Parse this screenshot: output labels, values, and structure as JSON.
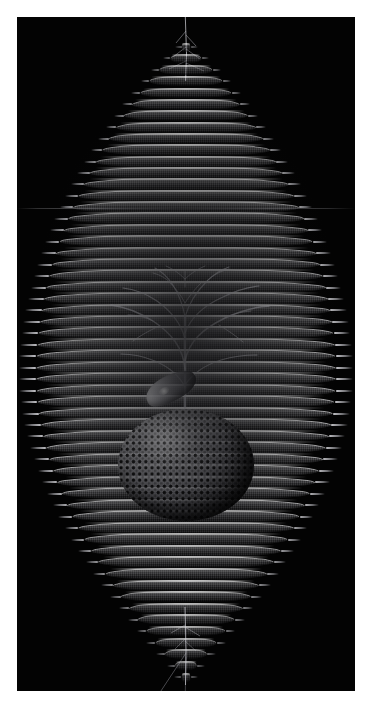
{
  "image": {
    "kind": "scientific-micrograph",
    "subject": "radiolarian-lattice-skeleton",
    "caption": "",
    "background_color": "#030303",
    "border_color": "#ffffff",
    "border_px": 17,
    "field": {
      "x": 17,
      "y": 17,
      "width": 338,
      "height": 674
    },
    "canvas": {
      "width": 371,
      "height": 709
    }
  },
  "specimen": {
    "silhouette": "spindle / lens shaped, pointed at top and bottom",
    "structures": [
      {
        "name": "apex-cone",
        "description": "stepped conical stack of narrowing rings with radiating spines",
        "top_y": 30,
        "bottom_y": 250
      },
      {
        "name": "equator-shell",
        "description": "widest tiers forming the lens body",
        "top_y": 250,
        "bottom_y": 470,
        "max_width_px": 300
      },
      {
        "name": "lower-cone",
        "description": "inverted stepped cone tapering to a terminal spine",
        "top_y": 470,
        "bottom_y": 660
      },
      {
        "name": "central-sphere",
        "description": "perforated spherical capsule with regular pore lattice",
        "center_x": 170,
        "center_y": 448,
        "width": 136,
        "height": 112
      },
      {
        "name": "glossy-teardrop",
        "description": "bright reflective teardrop body resting on the sphere",
        "center_x": 145,
        "center_y": 371
      },
      {
        "name": "dendritic-branch",
        "description": "tree-like branching filaments rising from the sphere apex",
        "top_y": 252,
        "bottom_y": 392
      },
      {
        "name": "apex-filament",
        "description": "single fine thread extending beyond the top of the frame"
      },
      {
        "name": "terminal-filament",
        "description": "fine V-shaped thread trailing from the bottom spine"
      }
    ],
    "tier_count": 56,
    "spine_rows": 56,
    "palette": {
      "shell_highlight": "#e6e6ea",
      "shell_mid": "#96969b",
      "shell_shadow": "#26262a",
      "pore_black": "#000000",
      "field_black": "#030303",
      "paper_white": "#ffffff"
    },
    "artifacts": [
      {
        "name": "film-scratch",
        "y": 208,
        "description": "faint horizontal streak across the full frame width"
      }
    ]
  }
}
